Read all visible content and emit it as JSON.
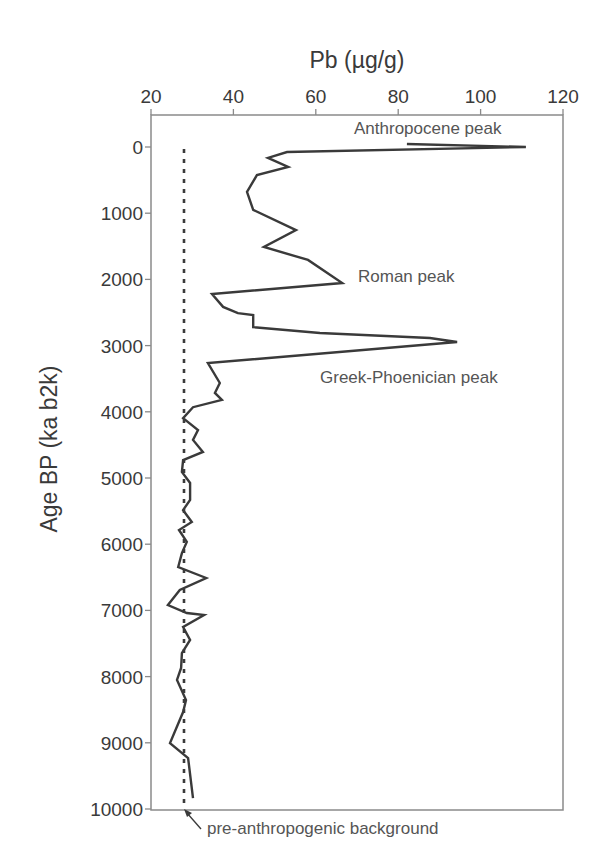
{
  "chart_data": {
    "type": "line",
    "title": "",
    "xlabel": "Pb (µg/g)",
    "ylabel": "Age BP (ka b2k)",
    "x_axis_position": "top",
    "y_axis_inverted": true,
    "xlim": [
      20,
      120
    ],
    "ylim": [
      0,
      10000
    ],
    "xticks": [
      20,
      40,
      60,
      80,
      100,
      120
    ],
    "yticks": [
      0,
      1000,
      2000,
      3000,
      4000,
      5000,
      6000,
      7000,
      8000,
      9000,
      10000
    ],
    "grid": false,
    "legend": null,
    "series": [
      {
        "name": "Pb concentration",
        "style": "solid",
        "color": "#3a3a3a",
        "points": [
          [
            82.1,
            -45
          ],
          [
            111.0,
            0
          ],
          [
            53.0,
            75
          ],
          [
            48.4,
            165
          ],
          [
            53.3,
            300
          ],
          [
            45.7,
            425
          ],
          [
            43.3,
            680
          ],
          [
            44.8,
            950
          ],
          [
            55.2,
            1255
          ],
          [
            47.4,
            1510
          ],
          [
            58.1,
            1705
          ],
          [
            66.4,
            2055
          ],
          [
            34.8,
            2220
          ],
          [
            37.5,
            2415
          ],
          [
            41.1,
            2510
          ],
          [
            44.8,
            2540
          ],
          [
            44.8,
            2720
          ],
          [
            61.0,
            2810
          ],
          [
            87.7,
            2885
          ],
          [
            94.3,
            2945
          ],
          [
            33.8,
            3265
          ],
          [
            36.7,
            3565
          ],
          [
            35.5,
            3715
          ],
          [
            37.2,
            3820
          ],
          [
            30.2,
            3930
          ],
          [
            27.8,
            4095
          ],
          [
            31.4,
            4275
          ],
          [
            30.2,
            4425
          ],
          [
            32.6,
            4605
          ],
          [
            27.8,
            4730
          ],
          [
            27.5,
            4910
          ],
          [
            29.5,
            5075
          ],
          [
            29.5,
            5330
          ],
          [
            27.8,
            5485
          ],
          [
            29.9,
            5665
          ],
          [
            26.8,
            5785
          ],
          [
            28.7,
            5965
          ],
          [
            27.5,
            6135
          ],
          [
            26.6,
            6345
          ],
          [
            33.4,
            6510
          ],
          [
            27.0,
            6690
          ],
          [
            24.1,
            6920
          ],
          [
            28.7,
            7040
          ],
          [
            32.9,
            7070
          ],
          [
            27.8,
            7250
          ],
          [
            29.5,
            7445
          ],
          [
            27.5,
            7645
          ],
          [
            27.3,
            7870
          ],
          [
            26.3,
            8050
          ],
          [
            28.5,
            8355
          ],
          [
            27.8,
            8535
          ],
          [
            24.6,
            9005
          ],
          [
            29.0,
            9230
          ],
          [
            30.2,
            9835
          ]
        ]
      },
      {
        "name": "pre-anthropogenic background",
        "style": "dotted",
        "color": "#3a3a3a",
        "points": [
          [
            28.0,
            0
          ],
          [
            28.0,
            10000
          ]
        ]
      }
    ],
    "annotations": [
      {
        "text": "Anthropocene peak",
        "x": 82,
        "y": -380
      },
      {
        "text": "Roman peak",
        "x": 69.5,
        "y": 2050
      },
      {
        "text": "Greek-Phoenician peak",
        "x": 61.5,
        "y": 3560
      },
      {
        "text": "pre-anthropogenic background",
        "x": 33.5,
        "y": 10360,
        "arrow_to": [
          28.0,
          10000
        ]
      }
    ]
  },
  "labels": {
    "x_axis_title": "Pb (µg/g)",
    "y_axis_title": "Age BP (ka b2k)",
    "annotation_anthropocene": "Anthropocene peak",
    "annotation_roman": "Roman peak",
    "annotation_greek": "Greek-Phoenician peak",
    "annotation_background": "pre-anthropogenic background"
  }
}
